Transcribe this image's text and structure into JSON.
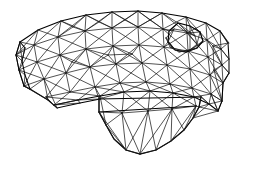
{
  "view": {
    "width": 255,
    "height": 170,
    "background_color": "#ffffff",
    "line_color": "#000000",
    "render_style": "wireframe-triangular-mesh",
    "subject": "3d-cad-solid-model",
    "description": "Triangulated surface mesh wireframe of an L-shaped bracket solid viewed in isometric-like projection"
  },
  "mesh_data": {
    "type": "wireframe",
    "projection": "axonometric",
    "element_type": "triangle",
    "shading": "none",
    "hidden_line_removal": false,
    "approx_vertex_count": 96,
    "approx_edge_count": 268,
    "features": [
      {
        "name": "top-face",
        "kind": "curved-top-surface"
      },
      {
        "name": "circular-hole",
        "kind": "through-hole-boss"
      },
      {
        "name": "left-arm",
        "kind": "tapered-arm"
      },
      {
        "name": "lower-block",
        "kind": "rectangular-protrusion"
      },
      {
        "name": "right-end-cap",
        "kind": "rounded-end-face"
      }
    ],
    "vertices": [
      [
        20,
        42
      ],
      [
        38,
        30
      ],
      [
        60,
        21
      ],
      [
        86,
        15
      ],
      [
        112,
        12
      ],
      [
        138,
        11
      ],
      [
        162,
        13
      ],
      [
        186,
        17
      ],
      [
        206,
        23
      ],
      [
        220,
        31
      ],
      [
        228,
        42
      ],
      [
        15,
        56
      ],
      [
        34,
        46
      ],
      [
        58,
        37
      ],
      [
        85,
        31
      ],
      [
        112,
        28
      ],
      [
        138,
        27
      ],
      [
        163,
        29
      ],
      [
        187,
        33
      ],
      [
        207,
        40
      ],
      [
        222,
        49
      ],
      [
        230,
        60
      ],
      [
        18,
        72
      ],
      [
        37,
        63
      ],
      [
        60,
        55
      ],
      [
        86,
        49
      ],
      [
        113,
        46
      ],
      [
        139,
        45
      ],
      [
        164,
        47
      ],
      [
        188,
        51
      ],
      [
        208,
        57
      ],
      [
        223,
        66
      ],
      [
        24,
        88
      ],
      [
        44,
        80
      ],
      [
        66,
        73
      ],
      [
        90,
        67
      ],
      [
        116,
        64
      ],
      [
        142,
        63
      ],
      [
        167,
        65
      ],
      [
        190,
        69
      ],
      [
        210,
        75
      ],
      [
        224,
        84
      ],
      [
        46,
        99
      ],
      [
        70,
        93
      ],
      [
        95,
        87
      ],
      [
        120,
        83
      ],
      [
        146,
        82
      ],
      [
        170,
        84
      ],
      [
        192,
        88
      ],
      [
        211,
        94
      ],
      [
        222,
        102
      ],
      [
        54,
        106
      ],
      [
        78,
        101
      ],
      [
        100,
        96
      ],
      [
        124,
        92
      ],
      [
        150,
        91
      ],
      [
        173,
        93
      ],
      [
        194,
        97
      ],
      [
        209,
        104
      ],
      [
        218,
        112
      ],
      [
        178,
        22
      ],
      [
        190,
        26
      ],
      [
        200,
        32
      ],
      [
        203,
        41
      ],
      [
        197,
        48
      ],
      [
        186,
        52
      ],
      [
        175,
        50
      ],
      [
        168,
        42
      ],
      [
        169,
        31
      ],
      [
        98,
        100
      ],
      [
        104,
        110
      ],
      [
        110,
        122
      ],
      [
        117,
        136
      ],
      [
        126,
        148
      ],
      [
        140,
        152
      ],
      [
        156,
        148
      ],
      [
        170,
        140
      ],
      [
        182,
        130
      ],
      [
        190,
        120
      ],
      [
        196,
        110
      ],
      [
        199,
        100
      ],
      [
        92,
        105
      ],
      [
        96,
        118
      ],
      [
        102,
        132
      ],
      [
        110,
        144
      ],
      [
        122,
        151
      ],
      [
        136,
        154
      ],
      [
        150,
        151
      ],
      [
        164,
        144
      ],
      [
        176,
        134
      ],
      [
        186,
        123
      ],
      [
        193,
        112
      ]
    ]
  },
  "labels": {
    "title": "",
    "caption": "",
    "annotations": []
  }
}
